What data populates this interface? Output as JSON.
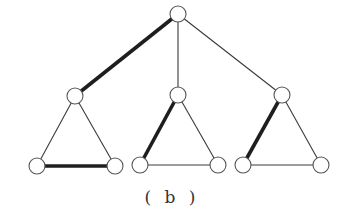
{
  "caption": "( b )",
  "colors": {
    "background": "#ffffff",
    "edge": "#3a3a3a",
    "highlight_edge": "#1e1e1e",
    "node_stroke": "#555555",
    "node_fill": "#ffffff"
  },
  "graph": {
    "node_radius": 8,
    "nodes": [
      {
        "id": "root",
        "x": 178,
        "y": 14
      },
      {
        "id": "L",
        "x": 75,
        "y": 96
      },
      {
        "id": "L1",
        "x": 37,
        "y": 166
      },
      {
        "id": "L2",
        "x": 115,
        "y": 166
      },
      {
        "id": "M",
        "x": 178,
        "y": 95
      },
      {
        "id": "M1",
        "x": 140,
        "y": 165
      },
      {
        "id": "M2",
        "x": 218,
        "y": 165
      },
      {
        "id": "R",
        "x": 282,
        "y": 95
      },
      {
        "id": "R1",
        "x": 243,
        "y": 165
      },
      {
        "id": "R2",
        "x": 321,
        "y": 165
      }
    ],
    "edges": [
      {
        "from": "root",
        "to": "L",
        "bold": true
      },
      {
        "from": "root",
        "to": "M",
        "bold": false
      },
      {
        "from": "root",
        "to": "R",
        "bold": false
      },
      {
        "from": "L",
        "to": "L1",
        "bold": false
      },
      {
        "from": "L",
        "to": "L2",
        "bold": false
      },
      {
        "from": "L1",
        "to": "L2",
        "bold": true
      },
      {
        "from": "M",
        "to": "M1",
        "bold": true
      },
      {
        "from": "M",
        "to": "M2",
        "bold": false
      },
      {
        "from": "M1",
        "to": "M2",
        "bold": false
      },
      {
        "from": "R",
        "to": "R1",
        "bold": true
      },
      {
        "from": "R",
        "to": "R2",
        "bold": false
      },
      {
        "from": "R1",
        "to": "R2",
        "bold": false
      }
    ]
  }
}
